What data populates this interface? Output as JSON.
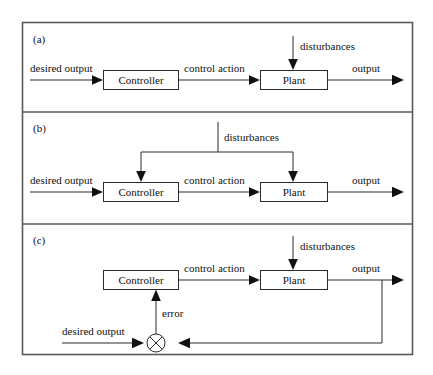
{
  "figure": {
    "type": "block-diagram",
    "panels": [
      {
        "tag": "(a)",
        "name": "open-loop-control",
        "blocks": [
          {
            "id": "controller",
            "label": "Controller"
          },
          {
            "id": "plant",
            "label": "Plant"
          }
        ],
        "signals": [
          {
            "id": "desired-output",
            "label": "desired output"
          },
          {
            "id": "control-action",
            "label": "control action"
          },
          {
            "id": "disturbances",
            "label": "disturbances"
          },
          {
            "id": "output",
            "label": "output"
          }
        ]
      },
      {
        "tag": "(b)",
        "name": "open-loop-control-with-measured-disturbances",
        "blocks": [
          {
            "id": "controller",
            "label": "Controller"
          },
          {
            "id": "plant",
            "label": "Plant"
          }
        ],
        "signals": [
          {
            "id": "desired-output",
            "label": "desired output"
          },
          {
            "id": "control-action",
            "label": "control action"
          },
          {
            "id": "disturbances",
            "label": "disturbances"
          },
          {
            "id": "output",
            "label": "output"
          }
        ]
      },
      {
        "tag": "(c)",
        "name": "closed-loop-feedback-control",
        "blocks": [
          {
            "id": "controller",
            "label": "Controller"
          },
          {
            "id": "plant",
            "label": "Plant"
          }
        ],
        "signals": [
          {
            "id": "desired-output",
            "label": "desired output"
          },
          {
            "id": "error",
            "label": "error"
          },
          {
            "id": "control-action",
            "label": "control action"
          },
          {
            "id": "disturbances",
            "label": "disturbances"
          },
          {
            "id": "output",
            "label": "output"
          }
        ],
        "junction": {
          "id": "summing-junction",
          "symbol": "circle-with-cross"
        }
      }
    ],
    "colors": {
      "line": "#2b2b2b",
      "frame": "#5a5a5a",
      "text": "#111111",
      "background": "#ffffff"
    }
  }
}
